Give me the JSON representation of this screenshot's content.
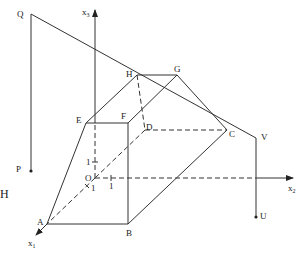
{
  "diagram": {
    "type": "3d-coordinate-polytope",
    "axes": {
      "x1": {
        "label": "x",
        "sub": "1"
      },
      "x2": {
        "label": "x",
        "sub": "2"
      },
      "x3": {
        "label": "x",
        "sub": "3"
      },
      "origin": "O",
      "unit_tick_labels": [
        "1",
        "1",
        "1"
      ]
    },
    "vertices": {
      "A": "A",
      "B": "B",
      "C": "C",
      "D": "D",
      "E": "E",
      "F": "F",
      "G": "G",
      "H": "H"
    },
    "points": {
      "P": "P",
      "Q": "Q",
      "U": "U",
      "V": "V"
    },
    "side_label": "H"
  }
}
